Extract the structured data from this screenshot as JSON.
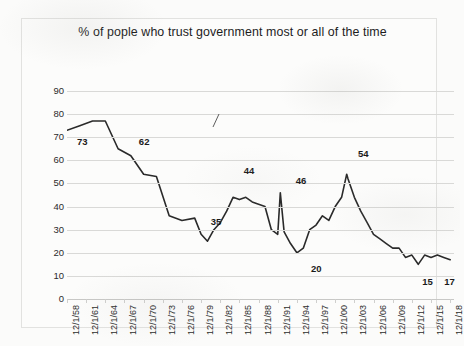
{
  "chart_data": {
    "type": "line",
    "title": "% of pople who trust government most or all of the time",
    "xlabel": "",
    "ylabel": "",
    "ylim": [
      0,
      90
    ],
    "ytick_step": 10,
    "yticks": [
      90,
      80,
      70,
      60,
      50,
      40,
      30,
      20,
      10,
      0
    ],
    "grid": true,
    "legend": "none",
    "xtick_labels": [
      "12/1/58",
      "12/1/61",
      "12/1/64",
      "12/1/67",
      "12/1/70",
      "12/1/73",
      "12/1/76",
      "12/1/79",
      "12/1/82",
      "12/1/85",
      "12/1/88",
      "12/1/91",
      "12/1/94",
      "12/1/97",
      "12/1/00",
      "12/1/03",
      "12/1/06",
      "12/1/09",
      "12/1/12",
      "12/1/15",
      "12/1/18"
    ],
    "xtick_step_years": 3,
    "x_start": "12/1/58",
    "x_end": "12/1/18",
    "series_name": "Trust in government",
    "line_color": "#2a2a2a",
    "annotations": [
      {
        "label": "73",
        "x": 1958,
        "y": 73
      },
      {
        "label": "62",
        "x": 1968,
        "y": 62
      },
      {
        "label": "35",
        "x": 1978,
        "y": 35
      },
      {
        "label": "44",
        "x": 1986,
        "y": 44
      },
      {
        "label": "46",
        "x": 1991,
        "y": 46
      },
      {
        "label": "20",
        "x": 1994,
        "y": 20
      },
      {
        "label": "54",
        "x": 2002,
        "y": 54
      },
      {
        "label": "15",
        "x": 2013,
        "y": 15
      },
      {
        "label": "17",
        "x": 2018,
        "y": 17
      }
    ],
    "x": [
      1958,
      1960,
      1962,
      1964,
      1966,
      1968,
      1970,
      1972,
      1974,
      1976,
      1978,
      1979,
      1980,
      1981,
      1982,
      1983,
      1984,
      1985,
      1986,
      1987,
      1988,
      1989,
      1990,
      1991,
      1991.4,
      1992,
      1993,
      1994,
      1995,
      1996,
      1997,
      1998,
      1999,
      2000,
      2001,
      2001.8,
      2002,
      2003,
      2004,
      2005,
      2006,
      2007,
      2008,
      2009,
      2010,
      2011,
      2012,
      2013,
      2014,
      2015,
      2016,
      2017,
      2018
    ],
    "y": [
      73,
      75,
      77,
      77,
      65,
      62,
      54,
      53,
      36,
      34,
      35,
      28,
      25,
      30,
      33,
      38,
      44,
      43,
      44,
      42,
      41,
      40,
      30,
      28,
      46,
      29,
      24,
      20,
      22,
      30,
      32,
      36,
      34,
      40,
      44,
      54,
      52,
      44,
      38,
      33,
      28,
      26,
      24,
      22,
      22,
      18,
      19,
      15,
      19,
      18,
      19,
      18,
      17
    ]
  },
  "y_axis": {
    "labels": [
      "90",
      "80",
      "70",
      "60",
      "50",
      "40",
      "30",
      "20",
      "10",
      "0"
    ]
  }
}
